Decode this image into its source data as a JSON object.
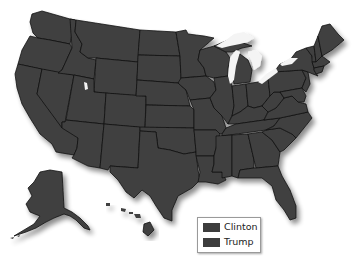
{
  "map": {
    "title": "",
    "region": "United States",
    "fill_color": "#404040",
    "border_color": "#111111",
    "lake_color": "#f4f4f4",
    "background": "#ffffff"
  },
  "legend": {
    "items": [
      {
        "label": "Clinton",
        "color": "#3d3d3d"
      },
      {
        "label": "Trump",
        "color": "#3d3d3d"
      }
    ]
  }
}
